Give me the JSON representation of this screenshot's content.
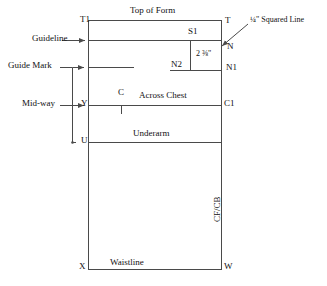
{
  "diagram": {
    "type": "pattern-drafting-diagram",
    "stroke_color": "#4a4a4a",
    "text_color": "#111111",
    "background": "#ffffff"
  },
  "headings": {
    "top_of_form": "Top of Form"
  },
  "left_annotations": [
    {
      "label": "Guideline"
    },
    {
      "label": "Guide Mark"
    },
    {
      "label": "Mid-way"
    }
  ],
  "right_annotations": [
    {
      "label": "¼\" Squared Line"
    }
  ],
  "horizontal_lines": [
    {
      "label": "Across Chest"
    },
    {
      "label": "Underarm"
    },
    {
      "label": "Waistline"
    }
  ],
  "vertical_lines": [
    {
      "label": "CF/CB"
    }
  ],
  "measurements": [
    {
      "value": "2",
      "fraction": "⅜",
      "unit": "\"",
      "full": "2 ⅜\""
    }
  ],
  "points": [
    {
      "id": "T1",
      "x": 80,
      "y": 20
    },
    {
      "id": "T",
      "x": 225,
      "y": 21
    },
    {
      "id": "S1",
      "x": 188,
      "y": 31
    },
    {
      "id": "N",
      "x": 227,
      "y": 47
    },
    {
      "id": "N2",
      "x": 171,
      "y": 62
    },
    {
      "id": "N1",
      "x": 226,
      "y": 66
    },
    {
      "id": "C",
      "x": 119,
      "y": 90
    },
    {
      "id": "Y",
      "x": 81,
      "y": 99
    },
    {
      "id": "C1",
      "x": 225,
      "y": 99
    },
    {
      "id": "U",
      "x": 81,
      "y": 136
    },
    {
      "id": "X",
      "x": 80,
      "y": 264
    },
    {
      "id": "W",
      "x": 225,
      "y": 264
    }
  ]
}
